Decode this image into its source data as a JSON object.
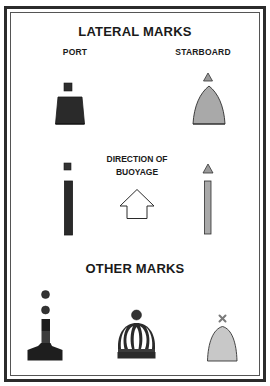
{
  "sections": {
    "lateral": {
      "title": "LATERAL MARKS",
      "port_label": "PORT",
      "starboard_label": "STARBOARD"
    },
    "direction": {
      "line1": "DIRECTION OF",
      "line2": "BUOYAGE"
    },
    "other": {
      "title": "OTHER MARKS"
    }
  },
  "marks": [
    {
      "name": "port-can-buoy",
      "topmark": "square",
      "shape": "can",
      "color": "#2a2a2a"
    },
    {
      "name": "starboard-conical-buoy",
      "topmark": "triangle",
      "shape": "cone",
      "color": "#a9a9a9"
    },
    {
      "name": "port-pillar",
      "topmark": "square",
      "shape": "pillar",
      "color": "#2a2a2a"
    },
    {
      "name": "starboard-pillar",
      "topmark": "triangle",
      "shape": "pillar",
      "color": "#a9a9a9"
    },
    {
      "name": "isolated-danger-mark",
      "topmark": "two-spheres",
      "shape": "beacon",
      "color": "#1e1e1e",
      "band_color": "#3a3a3a"
    },
    {
      "name": "safe-water-mark",
      "topmark": "sphere",
      "shape": "cage",
      "color": "#2a2a2a"
    },
    {
      "name": "special-mark",
      "topmark": "x-cross",
      "shape": "cone",
      "color": "#c8c8c8"
    }
  ],
  "colors": {
    "frame": "#2b2b2b",
    "port": "#2a2a2a",
    "starboard": "#a9a9a9",
    "special": "#c8c8c8",
    "text": "#1a1a1a"
  }
}
